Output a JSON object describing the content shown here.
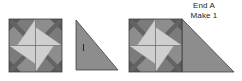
{
  "diagram": {
    "title_lines": {
      "line1": "End A",
      "line2": "Make 1"
    },
    "figure_count": 3,
    "figures": [
      {
        "name": "pinwheel-block",
        "description": "Four-patch pinwheel quilt block",
        "x": 9,
        "y": 19,
        "width": 53,
        "height": 53,
        "quadrants": 4
      },
      {
        "name": "corner-triangle",
        "description": "Right triangle setting piece with grain tick mark",
        "x": 76,
        "y": 20,
        "width": 42,
        "height": 50,
        "tick_mark": true
      },
      {
        "name": "assembled-end-unit",
        "description": "Pinwheel block joined to right triangle",
        "x": 129,
        "y": 19,
        "width": 105,
        "height": 53
      }
    ],
    "colors": {
      "background": "#ffffff",
      "fabric_medium": "#8d8d8d",
      "fabric_dark": "#5d5d5d",
      "fabric_light": "#cfcfcf",
      "fabric_mid_dark": "#747474",
      "fabric_very_light": "#e2e2e2",
      "outline": "#3a3a3a",
      "text": "#1c1c1c"
    }
  }
}
